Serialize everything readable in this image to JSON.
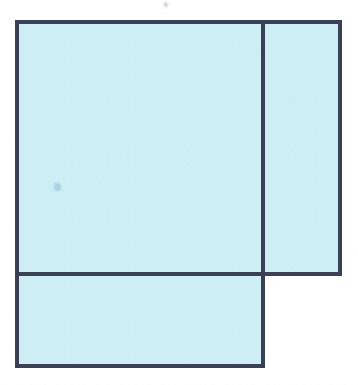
{
  "figure": {
    "canvas": {
      "width": 358,
      "height": 385,
      "background_color": "#ffffff"
    },
    "style": {
      "fill_color": "#cdeef4",
      "stroke_color": "#3a4055",
      "stroke_width": 4,
      "stroke_width_inner": 4
    },
    "guides": {
      "left_edge_x": 17,
      "divider_x": 263,
      "right_edge_x": 340,
      "top_edge_y": 22,
      "divider_y": 274,
      "bottom_edge_y": 366
    },
    "regions": [
      {
        "name": "upper-left-square",
        "label": "",
        "x": 17,
        "y": 22,
        "width": 246,
        "height": 252,
        "fill": "#cdeef4"
      },
      {
        "name": "right-tall-rectangle",
        "label": "",
        "x": 263,
        "y": 22,
        "width": 77,
        "height": 252,
        "fill": "#cdeef4"
      },
      {
        "name": "lower-left-rectangle",
        "label": "",
        "x": 17,
        "y": 274,
        "width": 246,
        "height": 92,
        "fill": "#cdeef4"
      }
    ],
    "segments": [
      {
        "name": "outer-top-edge",
        "x1": 17,
        "y1": 22,
        "x2": 340,
        "y2": 22
      },
      {
        "name": "outer-right-edge",
        "x1": 340,
        "y1": 22,
        "x2": 340,
        "y2": 274
      },
      {
        "name": "step-bottom-edge-right",
        "x1": 340,
        "y1": 274,
        "x2": 263,
        "y2": 274
      },
      {
        "name": "step-vertical-edge",
        "x1": 263,
        "y1": 274,
        "x2": 263,
        "y2": 366
      },
      {
        "name": "outer-bottom-edge",
        "x1": 263,
        "y1": 366,
        "x2": 17,
        "y2": 366
      },
      {
        "name": "outer-left-edge",
        "x1": 17,
        "y1": 366,
        "x2": 17,
        "y2": 22
      },
      {
        "name": "inner-vertical-divider",
        "x1": 263,
        "y1": 22,
        "x2": 263,
        "y2": 274
      },
      {
        "name": "inner-horizontal-divider",
        "x1": 17,
        "y1": 274,
        "x2": 272,
        "y2": 274
      }
    ],
    "marks": [
      {
        "name": "ink-smudge-left",
        "x": 54,
        "y": 183,
        "width": 7,
        "height": 8,
        "color": "rgba(120,170,200,0.45)"
      },
      {
        "name": "ink-speck-top",
        "x": 164,
        "y": 2,
        "width": 4,
        "height": 5,
        "color": "rgba(110,120,140,0.40)"
      }
    ]
  }
}
